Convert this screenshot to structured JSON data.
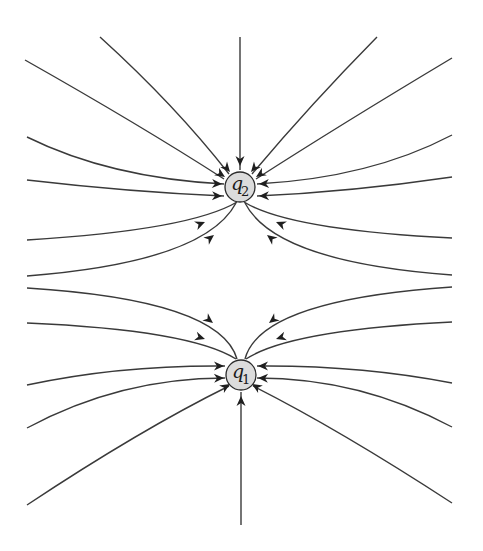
{
  "diagram": {
    "colors": {
      "line": "#3a3a3a",
      "charge_fill": "#dcdcdc",
      "charge_stroke": "#2a2a2a",
      "background": "#ffffff"
    },
    "charges": [
      {
        "id": "q2",
        "symbol": "q",
        "subscript": "2",
        "cx": 240,
        "cy": 187,
        "r": 15
      },
      {
        "id": "q1",
        "symbol": "q",
        "subscript": "1",
        "cx": 241,
        "cy": 375,
        "r": 15
      }
    ],
    "field_lines": [
      {
        "charge": "q2",
        "d": "M 240 37 L 240 170"
      },
      {
        "charge": "q2",
        "d": "M 100 37 Q 175 105 229 174"
      },
      {
        "charge": "q2",
        "d": "M 25 60 Q 140 125 224 179"
      },
      {
        "charge": "q2",
        "d": "M 27 137 Q 110 178 224 184"
      },
      {
        "charge": "q2",
        "d": "M 27 180 Q 130 192 224 196"
      },
      {
        "charge": "q2",
        "d": "M 27 240 Q 190 230 237 202"
      },
      {
        "charge": "q2",
        "d": "M 27 276 Q 205 262 236 203"
      },
      {
        "charge": "q2",
        "d": "M 377 37 Q 310 105 252 174"
      },
      {
        "charge": "q2",
        "d": "M 452 58 Q 340 125 256 179"
      },
      {
        "charge": "q2",
        "d": "M 452 135 Q 370 178 257 184"
      },
      {
        "charge": "q2",
        "d": "M 452 177 Q 350 192 257 196"
      },
      {
        "charge": "q2",
        "d": "M 452 238 Q 290 230 244 202"
      },
      {
        "charge": "q2",
        "d": "M 452 275 Q 275 262 245 203"
      },
      {
        "charge": "q1",
        "d": "M 241 525 L 241 392"
      },
      {
        "charge": "q1",
        "d": "M 27 288 Q 220 300 237 359"
      },
      {
        "charge": "q1",
        "d": "M 27 323 Q 190 330 236 359"
      },
      {
        "charge": "q1",
        "d": "M 27 385 Q 120 365 225 366"
      },
      {
        "charge": "q1",
        "d": "M 27 428 Q 120 378 225 378"
      },
      {
        "charge": "q1",
        "d": "M 27 505 Q 140 430 229 386"
      },
      {
        "charge": "q1",
        "d": "M 452 287 Q 260 300 245 359"
      },
      {
        "charge": "q1",
        "d": "M 452 322 Q 290 330 246 359"
      },
      {
        "charge": "q1",
        "d": "M 452 383 Q 360 365 257 366"
      },
      {
        "charge": "q1",
        "d": "M 452 427 Q 360 378 257 378"
      },
      {
        "charge": "q1",
        "d": "M 452 503 Q 340 430 253 386"
      }
    ],
    "arrows": [
      {
        "x": 240,
        "y": 166,
        "angle": 90
      },
      {
        "x": 230,
        "y": 172,
        "angle": 50
      },
      {
        "x": 225,
        "y": 177,
        "angle": 33
      },
      {
        "x": 222,
        "y": 184,
        "angle": 3
      },
      {
        "x": 222,
        "y": 196,
        "angle": 2
      },
      {
        "x": 205,
        "y": 222,
        "angle": -22
      },
      {
        "x": 214,
        "y": 235,
        "angle": -38
      },
      {
        "x": 251,
        "y": 172,
        "angle": 130
      },
      {
        "x": 256,
        "y": 177,
        "angle": 147
      },
      {
        "x": 259,
        "y": 184,
        "angle": 177
      },
      {
        "x": 259,
        "y": 196,
        "angle": 178
      },
      {
        "x": 276,
        "y": 222,
        "angle": -158
      },
      {
        "x": 267,
        "y": 235,
        "angle": -142
      },
      {
        "x": 241,
        "y": 396,
        "angle": -90
      },
      {
        "x": 213,
        "y": 323,
        "angle": 38
      },
      {
        "x": 205,
        "y": 339,
        "angle": 18
      },
      {
        "x": 224,
        "y": 366,
        "angle": 0
      },
      {
        "x": 224,
        "y": 378,
        "angle": -2
      },
      {
        "x": 230,
        "y": 384,
        "angle": -32
      },
      {
        "x": 269,
        "y": 323,
        "angle": 142
      },
      {
        "x": 276,
        "y": 339,
        "angle": 162
      },
      {
        "x": 258,
        "y": 366,
        "angle": 180
      },
      {
        "x": 258,
        "y": 378,
        "angle": -178
      },
      {
        "x": 252,
        "y": 384,
        "angle": -148
      }
    ]
  }
}
